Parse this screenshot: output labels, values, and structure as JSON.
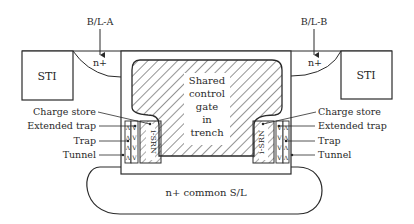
{
  "diagram": {
    "bitlines": {
      "left": "B/L-A",
      "right": "B/L-B"
    },
    "regions": {
      "sti_left": "STI",
      "sti_right": "STI",
      "nplus_left": "n+",
      "nplus_right": "n+",
      "gate_line1": "Shared",
      "gate_line2": "control",
      "gate_line3": "gate",
      "gate_line4": "in",
      "gate_line5": "trench",
      "common_sl": "n+ common S/L",
      "isrn_left": "i-SRN",
      "isrn_right": "i-SRN"
    },
    "layer_labels_left": [
      "Charge store",
      "Extended trap",
      "Trap",
      "Tunnel"
    ],
    "layer_labels_right": [
      "Charge store",
      "Extended trap",
      "Trap",
      "Tunnel"
    ],
    "colors": {
      "stroke": "#2a2a2a",
      "background": "#ffffff"
    }
  }
}
